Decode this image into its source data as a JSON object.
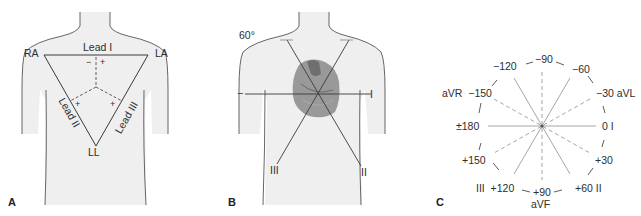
{
  "panels": {
    "a": {
      "letter": "A",
      "labels": {
        "ra": "RA",
        "la": "LA",
        "ll": "LL",
        "lead1": "Lead I",
        "lead2": "Lead II",
        "lead3": "Lead III",
        "minus": "−",
        "plus": "+"
      }
    },
    "b": {
      "letter": "B",
      "labels": {
        "angle": "60°",
        "lead1": "I",
        "lead2": "II",
        "lead3": "III",
        "minus": "−"
      }
    },
    "c": {
      "letter": "C",
      "labels": {
        "m90": "−90",
        "m120": "−120",
        "m60": "−60",
        "avr_m150": "aVR  −150",
        "m30_avl": "−30 aVL",
        "pm180": "±180",
        "zero_i": "0 I",
        "p150": "+150",
        "p30": "+30",
        "iii_p120": "III  +120",
        "p90": "+90",
        "p60_ii": "+60 II",
        "avf": "aVF"
      }
    }
  },
  "colors": {
    "torso_fill": "#efefef",
    "torso_outline": "#555555",
    "line": "#3a3a3a",
    "heart": "#8a8a8a",
    "axis_solid": "#9a9a9a",
    "axis_dashed": "#9a9a9a"
  }
}
